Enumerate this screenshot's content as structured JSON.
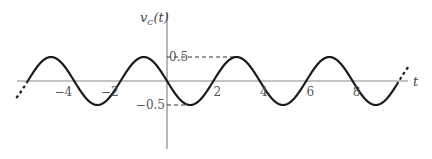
{
  "chart_data": {
    "type": "line",
    "title": "",
    "xlabel": "t",
    "ylabel": "v_C(t)",
    "ylabel_main": "v",
    "ylabel_sub": "C",
    "ylabel_arg": "(t)",
    "function": "v_C(t) = -0.5 sin(pi t / 2)",
    "amplitude": 0.5,
    "period": 4,
    "xlim": [
      -7,
      10.5
    ],
    "ylim": [
      -1.5,
      1.5
    ],
    "x_ticks": [
      -4,
      -2,
      2,
      4,
      6,
      8
    ],
    "x_tick_labels": [
      "−4",
      "−2",
      "2",
      "4",
      "6",
      "8"
    ],
    "y_ticks": [
      0.5,
      -0.5
    ],
    "y_tick_labels": [
      "0.5",
      "−0.5"
    ],
    "series": [
      {
        "name": "v_C(t)",
        "x": [
          -6.5,
          -6,
          -5,
          -4,
          -3,
          -2,
          -1,
          0,
          1,
          2,
          3,
          4,
          5,
          6,
          7,
          8,
          9,
          10,
          10.5
        ],
        "values": [
          -0.354,
          0,
          0.5,
          0,
          -0.5,
          0,
          0.5,
          0,
          -0.5,
          0,
          0.5,
          0,
          -0.5,
          0,
          0.5,
          0,
          -0.5,
          0,
          0.354
        ]
      }
    ],
    "dashed_extensions": "curve continues (dashed) beyond both ends",
    "reference_lines": [
      "dashed horizontal guide from y-axis to peak at 0.5",
      "dashed horizontal guide from y-axis to trough at -0.5"
    ],
    "grid": false,
    "legend": false
  }
}
